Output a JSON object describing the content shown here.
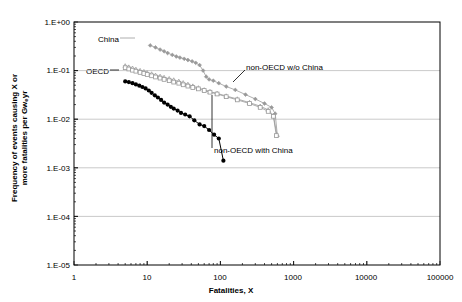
{
  "chart_data": {
    "type": "line",
    "title": "",
    "subtitle": "",
    "xlabel": "Fatalities, X",
    "ylabel_line1": "Frequency of events causing X or",
    "ylabel_line2": "more fatalities per Gw",
    "ylabel_sub": "e",
    "ylabel_line2_end": "yr",
    "xscale": "log",
    "yscale": "log",
    "xlim": [
      1,
      100000
    ],
    "ylim": [
      1e-05,
      1
    ],
    "grid": "horizontal",
    "legend_position": "inline-annotations",
    "xticks": [
      "1",
      "10",
      "100",
      "1000",
      "10000",
      "100000"
    ],
    "xtick_values": [
      1,
      10,
      100,
      1000,
      10000,
      100000
    ],
    "yticks": [
      "1.E+00",
      "1.E-01",
      "1.E-02",
      "1.E-03",
      "1.E-04",
      "1.E-05"
    ],
    "ytick_values": [
      1,
      0.1,
      0.01,
      0.001,
      0.0001,
      1e-05
    ],
    "series": [
      {
        "name": "China",
        "label": "China",
        "color": "#999999",
        "marker": "diamond",
        "points": [
          [
            11,
            0.33
          ],
          [
            13,
            0.3
          ],
          [
            15,
            0.27
          ],
          [
            17,
            0.25
          ],
          [
            19,
            0.23
          ],
          [
            22,
            0.21
          ],
          [
            25,
            0.195
          ],
          [
            28,
            0.185
          ],
          [
            32,
            0.175
          ],
          [
            36,
            0.165
          ],
          [
            41,
            0.155
          ],
          [
            46,
            0.145
          ],
          [
            52,
            0.13
          ],
          [
            58,
            0.1
          ],
          [
            64,
            0.075
          ],
          [
            70,
            0.066
          ],
          [
            80,
            0.062
          ],
          [
            95,
            0.055
          ],
          [
            120,
            0.047
          ],
          [
            160,
            0.04
          ],
          [
            220,
            0.032
          ],
          [
            300,
            0.026
          ],
          [
            400,
            0.021
          ],
          [
            500,
            0.0175
          ],
          [
            560,
            0.013
          ],
          [
            600,
            0.0045
          ]
        ]
      },
      {
        "name": "non-OECD with China",
        "label": "non-OECD with China",
        "color": "#999999",
        "marker": "triangle",
        "points": [
          [
            5,
            0.125
          ],
          [
            5.6,
            0.118
          ],
          [
            6.3,
            0.112
          ],
          [
            7,
            0.106
          ],
          [
            8,
            0.1
          ],
          [
            9,
            0.095
          ],
          [
            10,
            0.09
          ],
          [
            11.5,
            0.085
          ],
          [
            13,
            0.08
          ],
          [
            15,
            0.076
          ],
          [
            17,
            0.072
          ],
          [
            20,
            0.068
          ],
          [
            23,
            0.064
          ],
          [
            27,
            0.06
          ],
          [
            31,
            0.056
          ],
          [
            36,
            0.052
          ],
          [
            42,
            0.048
          ],
          [
            50,
            0.044
          ],
          [
            60,
            0.04
          ],
          [
            72,
            0.037
          ],
          [
            90,
            0.034
          ],
          [
            120,
            0.03
          ],
          [
            170,
            0.026
          ],
          [
            250,
            0.022
          ],
          [
            350,
            0.0185
          ],
          [
            450,
            0.0155
          ],
          [
            530,
            0.012
          ],
          [
            590,
            0.0048
          ]
        ]
      },
      {
        "name": "non-OECD w/o China",
        "label": "non-OECD w/o China",
        "color": "#999999",
        "marker": "square",
        "points": [
          [
            5,
            0.115
          ],
          [
            5.6,
            0.108
          ],
          [
            6.3,
            0.102
          ],
          [
            7,
            0.097
          ],
          [
            8,
            0.092
          ],
          [
            9,
            0.087
          ],
          [
            10,
            0.083
          ],
          [
            11.5,
            0.078
          ],
          [
            13,
            0.074
          ],
          [
            15,
            0.07
          ],
          [
            17,
            0.066
          ],
          [
            20,
            0.062
          ],
          [
            23,
            0.058
          ],
          [
            27,
            0.055
          ],
          [
            31,
            0.051
          ],
          [
            36,
            0.048
          ],
          [
            42,
            0.045
          ],
          [
            50,
            0.042
          ],
          [
            60,
            0.039
          ],
          [
            72,
            0.036
          ],
          [
            90,
            0.033
          ],
          [
            120,
            0.029
          ],
          [
            170,
            0.025
          ],
          [
            250,
            0.021
          ],
          [
            350,
            0.0175
          ],
          [
            450,
            0.0145
          ],
          [
            530,
            0.0115
          ],
          [
            580,
            0.0046
          ]
        ]
      },
      {
        "name": "OECD",
        "label": "OECD",
        "color": "#000000",
        "marker": "circle",
        "points": [
          [
            5,
            0.06
          ],
          [
            5.6,
            0.058
          ],
          [
            6.3,
            0.055
          ],
          [
            7,
            0.052
          ],
          [
            7.8,
            0.049
          ],
          [
            8.6,
            0.046
          ],
          [
            9.5,
            0.043
          ],
          [
            10.5,
            0.039
          ],
          [
            11.5,
            0.035
          ],
          [
            12.7,
            0.031
          ],
          [
            14,
            0.028
          ],
          [
            15.5,
            0.025
          ],
          [
            17,
            0.022
          ],
          [
            19,
            0.02
          ],
          [
            21,
            0.018
          ],
          [
            23,
            0.0165
          ],
          [
            26,
            0.015
          ],
          [
            29,
            0.0135
          ],
          [
            33,
            0.0125
          ],
          [
            38,
            0.0115
          ],
          [
            44,
            0.0095
          ],
          [
            52,
            0.0078
          ],
          [
            60,
            0.0072
          ],
          [
            70,
            0.006
          ],
          [
            82,
            0.0048
          ],
          [
            95,
            0.004
          ],
          [
            110,
            0.0014
          ]
        ]
      }
    ],
    "annotations": [
      {
        "text": "China",
        "series": "China"
      },
      {
        "text": "OECD",
        "series": "OECD"
      },
      {
        "text": "non-OECD w/o China",
        "series": "non-OECD w/o China"
      },
      {
        "text": "non-OECD with China",
        "series": "non-OECD with China"
      }
    ]
  },
  "colors": {
    "series_gray": "#999999",
    "series_black": "#000000",
    "gridline": "#b3b3b3",
    "axis": "#000000",
    "background": "#ffffff"
  }
}
